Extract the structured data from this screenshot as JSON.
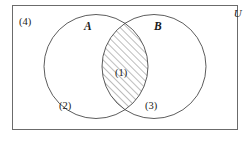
{
  "figure": {
    "type": "venn-diagram",
    "universe_label": "U",
    "sets": [
      {
        "id": "A",
        "label": "A"
      },
      {
        "id": "B",
        "label": "B"
      }
    ],
    "regions": [
      {
        "id": "intersection",
        "label": "(1)",
        "shaded": true
      },
      {
        "id": "a-only",
        "label": "(2)",
        "shaded": false
      },
      {
        "id": "b-only",
        "label": "(3)",
        "shaded": false
      },
      {
        "id": "outside",
        "label": "(4)",
        "shaded": false
      }
    ],
    "colors": {
      "stroke": "#4a4a4a",
      "frame": "#6b6b6b",
      "hatch": "#5a5a5a",
      "text": "#1a1a1a",
      "background": "#ffffff"
    }
  }
}
